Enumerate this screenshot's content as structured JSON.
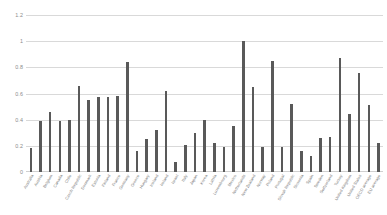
{
  "chart_data": {
    "type": "bar",
    "title": "",
    "subtitle": "",
    "xlabel": "",
    "ylabel": "",
    "ylim": [
      0,
      1.2
    ],
    "yticks": [
      "0",
      "0.2",
      "0.4",
      "0.6",
      "0.8",
      "1",
      "1.2"
    ],
    "ytick_values": [
      0,
      0.2,
      0.4,
      0.6,
      0.8,
      1.0,
      1.2
    ],
    "grid": true,
    "legend": false,
    "legend_position": "none",
    "bar_color": "#595959",
    "grid_color": "#d9d9d9",
    "categories": [
      "Australia",
      "Austria",
      "Belgium",
      "Canada",
      "Chile",
      "Czech Republic",
      "Denmark",
      "Estonia",
      "Finland",
      "France",
      "Germany",
      "Greece",
      "Hungary",
      "Iceland",
      "Ireland",
      "Israel",
      "Italy",
      "Japan",
      "Korea",
      "Latvia",
      "Luxembourg",
      "Mexico",
      "Netherlands",
      "New Zealand",
      "Norway",
      "Poland",
      "Portugal",
      "Slovak Republic",
      "Slovenia",
      "Spain",
      "Sweden",
      "Switzerland",
      "Turkey",
      "United Kingdom",
      "United States",
      "OECD average",
      "EU average"
    ],
    "values": [
      0.18,
      0.39,
      0.46,
      0.39,
      0.4,
      0.66,
      0.55,
      0.57,
      0.57,
      0.58,
      0.84,
      0.16,
      0.25,
      0.32,
      0.62,
      0.08,
      0.21,
      0.3,
      0.4,
      0.22,
      0.19,
      0.35,
      1.0,
      0.65,
      0.19,
      0.85,
      0.19,
      0.52,
      0.16,
      0.12,
      0.26,
      0.27,
      0.87,
      0.44,
      0.76,
      0.51,
      0.22
    ]
  },
  "caption": {
    "text": ""
  }
}
